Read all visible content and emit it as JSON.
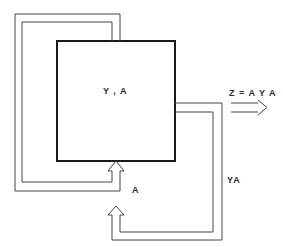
{
  "diagram": {
    "type": "flow-diagram",
    "box": {
      "label": "Y , A"
    },
    "output": {
      "label": "Z = A Y A"
    },
    "feedback_inner": {
      "label": "A"
    },
    "feedback_outer": {
      "label": "YA"
    },
    "colors": {
      "line": "#3a3a3a",
      "box_border": "#1a1a1a",
      "background": "#ffffff"
    }
  }
}
